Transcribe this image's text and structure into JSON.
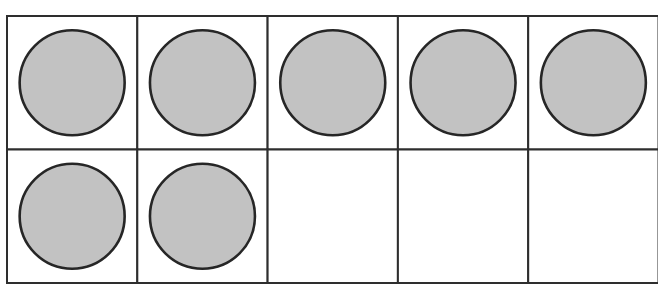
{
  "figure": {
    "type": "ten-frame",
    "title": "Ten frame showing 7",
    "rows": 2,
    "columns": 5,
    "filled_count": 7,
    "total_cells": 10,
    "cells": [
      {
        "row": 1,
        "col": 1,
        "filled": true
      },
      {
        "row": 1,
        "col": 2,
        "filled": true
      },
      {
        "row": 1,
        "col": 3,
        "filled": true
      },
      {
        "row": 1,
        "col": 4,
        "filled": true
      },
      {
        "row": 1,
        "col": 5,
        "filled": true
      },
      {
        "row": 2,
        "col": 1,
        "filled": true
      },
      {
        "row": 2,
        "col": 2,
        "filled": true
      },
      {
        "row": 2,
        "col": 3,
        "filled": false
      },
      {
        "row": 2,
        "col": 4,
        "filled": false
      },
      {
        "row": 2,
        "col": 5,
        "filled": false
      }
    ],
    "colors": {
      "grid_line": "#2e2e2e",
      "counter_fill": "#c2c2c2",
      "counter_stroke": "#262626",
      "background": "#ffffff"
    }
  }
}
